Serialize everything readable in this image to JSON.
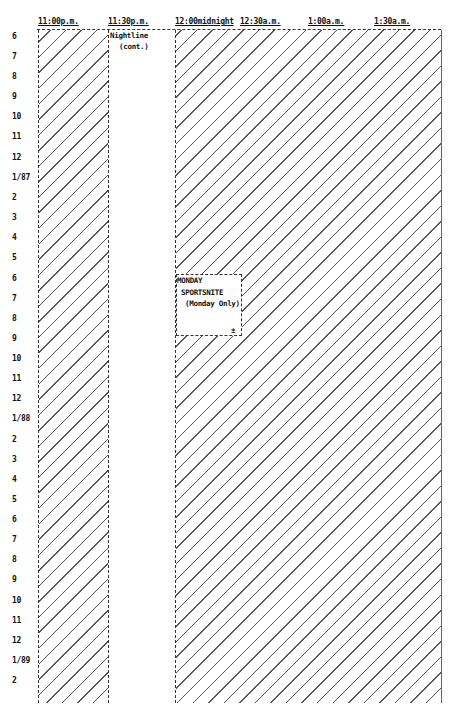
{
  "header": {
    "times": [
      "11:00p.m.",
      "11:30p.m.",
      "12:00midnight",
      "12:30a.m.",
      "1:00a.m.",
      "1:30a.m."
    ]
  },
  "rows": [
    "6",
    "7",
    "8",
    "9",
    "10",
    "11",
    "12",
    "1/87",
    "2",
    "3",
    "4",
    "5",
    "6",
    "7",
    "8",
    "9",
    "10",
    "11",
    "12",
    "1/88",
    "2",
    "3",
    "4",
    "5",
    "6",
    "7",
    "8",
    "9",
    "10",
    "11",
    "12",
    "1/89",
    "2"
  ],
  "programs": {
    "nightline": {
      "title": "Nightline",
      "subtitle": "(cont.)"
    },
    "sportsnite": {
      "line1": "MONDAY",
      "line2": "SPORTSNITE",
      "line3": "(Monday Only)",
      "mark": "±"
    }
  }
}
